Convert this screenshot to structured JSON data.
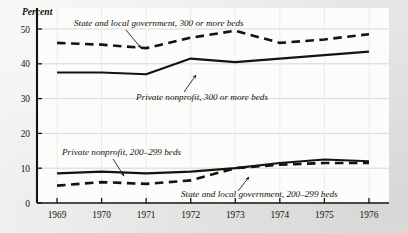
{
  "figure": {
    "axis_title": "Percent",
    "background_color": "#e9e9e7",
    "plot_background_color": "#fcfcfb",
    "ink_color": "#16120f",
    "grid_color": "#d8d8d6"
  },
  "chart_data": {
    "type": "line",
    "title": "",
    "subtitle": "",
    "xlabel": "",
    "ylabel": "Percent",
    "x": [
      1969,
      1970,
      1971,
      1972,
      1973,
      1974,
      1975,
      1976
    ],
    "categories": [
      "1969",
      "1970",
      "1971",
      "1972",
      "1973",
      "1974",
      "1975",
      "1976"
    ],
    "xlim": [
      1968.55,
      1976.45
    ],
    "ylim": [
      0,
      50
    ],
    "yticks": [
      0,
      10,
      20,
      30,
      40,
      50
    ],
    "ytick_labels": [
      "0",
      "10",
      "20",
      "30",
      "40",
      "50"
    ],
    "xticks": [
      1969,
      1970,
      1971,
      1972,
      1973,
      1974,
      1975,
      1976
    ],
    "xtick_labels": [
      "1969",
      "1970",
      "1971",
      "1972",
      "1973",
      "1974",
      "1975",
      "1976"
    ],
    "grid": true,
    "grid_axis": "both",
    "legend": false,
    "legend_position": "inline-annotations",
    "series": [
      {
        "name": "State and local government, 300 or more beds",
        "style": "dashed",
        "values": [
          46.0,
          45.5,
          44.5,
          47.5,
          49.5,
          46.0,
          47.0,
          48.5
        ]
      },
      {
        "name": "Private nonprofit, 300 or more beds",
        "style": "solid",
        "values": [
          37.5,
          37.5,
          37.0,
          41.5,
          40.5,
          41.5,
          42.5,
          43.5
        ]
      },
      {
        "name": "Private nonprofit, 200-299 beds",
        "style": "solid",
        "values": [
          8.5,
          9.0,
          8.5,
          9.0,
          10.0,
          11.5,
          12.5,
          12.0
        ]
      },
      {
        "name": "State and local government, 200-299 beds",
        "style": "dashed",
        "values": [
          5.0,
          6.0,
          5.5,
          6.5,
          10.0,
          11.0,
          11.5,
          11.5
        ]
      }
    ],
    "annotations": [
      {
        "id": "state-local-300",
        "text": "State and local government, 300 or more beds",
        "text_x": 74,
        "text_y": 26,
        "anchor": "start",
        "leader": "M 126,30 L 141,48"
      },
      {
        "id": "private-nonprofit-300",
        "text": "Private nonprofit, 300 or more beds",
        "text_x": 136,
        "text_y": 100,
        "anchor": "start",
        "leader": "M 184,92 L 196,75"
      },
      {
        "id": "private-nonprofit-200",
        "text": "Private nonprofit, 200–299 beds",
        "text_x": 62,
        "text_y": 155,
        "anchor": "start",
        "leader": "M 113,159 L 124,176"
      },
      {
        "id": "state-local-200",
        "text": "State and local government, 200–299 beds",
        "text_x": 181,
        "text_y": 197,
        "anchor": "start",
        "leader": "M 238,191 L 249,177"
      }
    ]
  }
}
